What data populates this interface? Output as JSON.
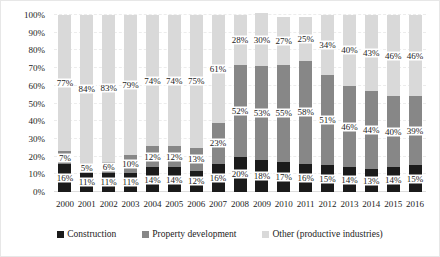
{
  "chart_data": {
    "type": "bar",
    "variant": "100-percent-stacked-column",
    "title": "",
    "xlabel": "",
    "ylabel": "",
    "categories": [
      "2000",
      "2001",
      "2002",
      "2003",
      "2004",
      "2005",
      "2006",
      "2007",
      "2008",
      "2009",
      "2010",
      "2011",
      "2012",
      "2013",
      "2014",
      "2015",
      "2016"
    ],
    "series": [
      {
        "key": "construction",
        "name": "Construction",
        "color": "#1b1b1b",
        "values": [
          16,
          11,
          11,
          11,
          14,
          14,
          12,
          16,
          20,
          18,
          17,
          16,
          15,
          14,
          13,
          14,
          15
        ]
      },
      {
        "key": "property-development",
        "name": "Property development",
        "color": "#878787",
        "values": [
          7,
          5,
          6,
          10,
          12,
          12,
          13,
          23,
          52,
          53,
          55,
          58,
          51,
          46,
          44,
          40,
          39
        ]
      },
      {
        "key": "other-productive-industries",
        "name": "Other (productive industries)",
        "color": "#d9d9d9",
        "values": [
          77,
          84,
          83,
          79,
          74,
          74,
          75,
          61,
          28,
          30,
          27,
          25,
          34,
          40,
          43,
          46,
          46
        ]
      }
    ],
    "data_label_suffix": "%",
    "y_axis": {
      "min": 0,
      "max": 100,
      "tick_step": 10,
      "tick_labels": [
        "0%",
        "10%",
        "20%",
        "30%",
        "40%",
        "50%",
        "60%",
        "70%",
        "80%",
        "90%",
        "100%"
      ]
    },
    "grid": true,
    "legend_position": "bottom"
  }
}
